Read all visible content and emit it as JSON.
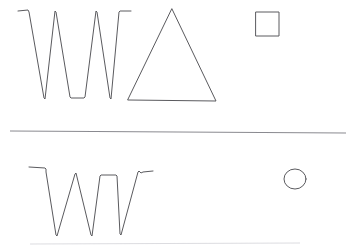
{
  "canvas": {
    "title": "Hand-drawn shape sketch",
    "width": 357,
    "height": 250,
    "background_color": "#ffffff",
    "stroke_color": "#5a5a5e",
    "divider_color": "#8a8a90",
    "faint_color": "#d8d8dc"
  },
  "top_panel": {
    "name": "upper-drawing-area",
    "shapes": [
      {
        "id": "zigzag-w-top",
        "label": "zigzag W",
        "type": "polyline",
        "points": "18,11 28,10 29,12 44,98 45,99 55,11 56,12 70,97 71,98 84,98 85,97 96,11 97,12 110,98 111,99 119,12 120,11 131,11"
      },
      {
        "id": "triangle",
        "label": "triangle",
        "type": "polygon",
        "points": "172,9 216,101 128,100"
      },
      {
        "id": "square",
        "label": "square",
        "type": "polygon",
        "points": "256,12 279,12 279,36 256,36"
      }
    ]
  },
  "divider": {
    "name": "horizontal-divider",
    "label": "horizontal rule",
    "x1": 10,
    "y1": 131,
    "x2": 346,
    "y2": 133
  },
  "bottom_panel": {
    "name": "lower-drawing-area",
    "shapes": [
      {
        "id": "zigzag-w-bottom",
        "label": "zigzag W",
        "type": "polyline",
        "points": "29,167 45,168 46,169 46,172 56,235 57,236 75,174 76,173 91,235 92,236 100,176 101,175 116,175 117,176 120,234 121,235 138,172 139,171 141,173 143,172 153,171"
      },
      {
        "id": "circle",
        "label": "circle",
        "type": "ellipse",
        "cx": 295,
        "cy": 179,
        "rx": 11,
        "ry": 10
      }
    ]
  },
  "footer_line": {
    "name": "faint-bottom-line",
    "label": "faint baseline",
    "x1": 30,
    "y1": 244,
    "x2": 300,
    "y2": 243
  }
}
